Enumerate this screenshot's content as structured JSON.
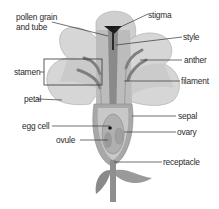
{
  "labels": {
    "pollen_line1": "pollen grain",
    "pollen_line2": "and tube",
    "stigma": "stigma",
    "style": "style",
    "stamen": "stamen",
    "anther": "anther",
    "filament": "filament",
    "petal": "petal",
    "sepal": "sepal",
    "egg_cell": "egg cell",
    "ovary": "ovary",
    "ovule": "ovule",
    "receptacle": "receptacle"
  },
  "colors": {
    "petal_light": "#d9d9d9",
    "petal_mid": "#bdbdbd",
    "petal_dark": "#9a9a9a",
    "stem": "#8f8f8f",
    "leader_line": "#333333",
    "text": "#2a2a2a"
  }
}
